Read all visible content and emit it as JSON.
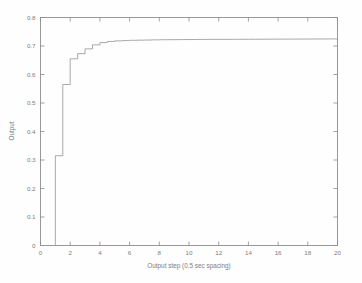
{
  "chart_data": {
    "type": "line",
    "title": "",
    "subtitle": "",
    "xlabel": "Output step (0.5 sec spacing)",
    "ylabel": "Output",
    "xlim": [
      0,
      20
    ],
    "ylim": [
      0,
      0.8
    ],
    "xticks": [
      0,
      2,
      4,
      6,
      8,
      10,
      12,
      14,
      16,
      18,
      20
    ],
    "xtick_labels": [
      "0",
      "2",
      "4",
      "6",
      "8",
      "10",
      "12",
      "14",
      "16",
      "18",
      "20"
    ],
    "yticks": [
      0,
      0.1,
      0.2,
      0.3,
      0.4,
      0.5,
      0.6,
      0.7,
      0.8
    ],
    "ytick_labels": [
      "0",
      "0.1",
      "0.2",
      "0.3",
      "0.4",
      "0.5",
      "0.6",
      "0.7",
      "0.8"
    ],
    "grid": false,
    "legend": null,
    "legend_position": "none",
    "drawstyle": "steps-post",
    "series": [
      {
        "name": "Output",
        "color": "#9a9a9a",
        "x": [
          0,
          0.5,
          1.0,
          1.5,
          2.0,
          2.5,
          3.0,
          3.5,
          4.0,
          4.5,
          5.0,
          5.5,
          6.0,
          6.5,
          7.0,
          7.5,
          8.0,
          8.5,
          9.0,
          9.5,
          10.0,
          10.5,
          11.0,
          11.5,
          12.0,
          12.5,
          13.0,
          13.5,
          14.0,
          14.5,
          15.0,
          15.5,
          16.0,
          16.5,
          17.0,
          17.5,
          18.0,
          18.5,
          19.0,
          19.5,
          20.0
        ],
        "values": [
          0,
          0,
          0.315,
          0.565,
          0.655,
          0.673,
          0.69,
          0.704,
          0.712,
          0.716,
          0.718,
          0.719,
          0.72,
          0.7205,
          0.721,
          0.7215,
          0.722,
          0.7222,
          0.7224,
          0.7226,
          0.7228,
          0.723,
          0.7231,
          0.7232,
          0.7233,
          0.7234,
          0.7235,
          0.7236,
          0.7237,
          0.7238,
          0.7239,
          0.724,
          0.7241,
          0.7242,
          0.7243,
          0.7244,
          0.7245,
          0.7246,
          0.7247,
          0.7248,
          0.7249
        ]
      }
    ],
    "annotations": [],
    "steady_state_value": 0.725,
    "step_onset_x": 0.5,
    "background_color": "#ffffff",
    "axis_color": "#8c8c8c"
  },
  "figure": {
    "window_background": "#ffffff",
    "axes_background": "#ffffff"
  }
}
